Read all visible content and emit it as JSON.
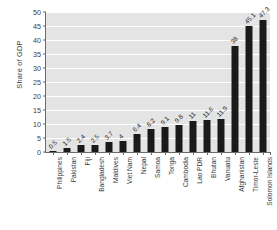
{
  "chart_data": {
    "type": "bar",
    "title": "",
    "subtitle": "",
    "xlabel": "",
    "ylabel": "Share of GDP",
    "ylim": [
      0,
      50
    ],
    "ytick_step": 5,
    "ytick_labels": [
      "0",
      "5",
      "10",
      "15",
      "20",
      "25",
      "30",
      "35",
      "40",
      "45",
      "50"
    ],
    "grid": true,
    "grid_axis": "y",
    "legend": false,
    "legend_position": "none",
    "orientation": "vertical",
    "bar_color": "#1a1a1a",
    "plot_background": "#e4e4e4",
    "gridline_color": "#ffffff",
    "categories": [
      "Philippines",
      "Pakistan",
      "Fiji",
      "Bangladesh",
      "Maldives",
      "Viet Nam",
      "Nepal",
      "Samoa",
      "Tonga",
      "Cambodia",
      "Lao PDR",
      "Bhutan",
      "Vanuatu",
      "Afghanistan",
      "Timor-Leste",
      "Solomon Islands"
    ],
    "values": [
      0.5,
      1.5,
      2.4,
      2.5,
      3.7,
      4,
      6.4,
      8.2,
      9.1,
      9.8,
      11,
      11.6,
      11.9,
      38,
      45.1,
      47.3
    ],
    "value_labels": [
      "0.5",
      "1.5",
      "2.4",
      "2.5",
      "3.7",
      "4",
      "6.4",
      "8.2",
      "9.1",
      "9.8",
      "11",
      "11.6",
      "11.9",
      "38",
      "45.1",
      "47.3"
    ]
  }
}
